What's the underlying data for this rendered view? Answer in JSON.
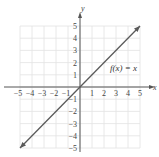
{
  "chart_data": {
    "type": "line",
    "title": "",
    "xlabel": "x",
    "ylabel": "y",
    "xlim": [
      -5,
      5
    ],
    "ylim": [
      -5,
      5
    ],
    "grid": true,
    "x_ticks": [
      -5,
      -4,
      -3,
      -2,
      -1,
      1,
      2,
      3,
      4,
      5
    ],
    "y_ticks": [
      -5,
      -4,
      -3,
      -2,
      -1,
      1,
      2,
      3,
      4,
      5
    ],
    "series": [
      {
        "name": "f(x) = x",
        "x": [
          -5,
          5
        ],
        "y": [
          -5,
          5
        ],
        "arrows_both_ends": true,
        "color": "#5a5a5a"
      }
    ],
    "annotations": [
      {
        "text": "f(x) = x",
        "x": 3.6,
        "y": 1.6
      }
    ]
  },
  "colors": {
    "grid": "#e2e2e2",
    "axis": "#555555",
    "line": "#5a5a5a"
  }
}
